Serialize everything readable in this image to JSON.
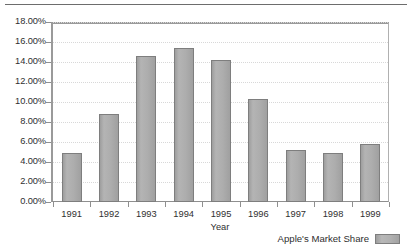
{
  "top_rule": {
    "visible": true
  },
  "chart_data": {
    "type": "bar",
    "title": "",
    "xlabel": "Year",
    "ylabel": "",
    "categories": [
      "1991",
      "1992",
      "1993",
      "1994",
      "1995",
      "1996",
      "1997",
      "1998",
      "1999"
    ],
    "values": [
      4.9,
      8.8,
      14.6,
      15.45,
      14.2,
      10.35,
      5.2,
      4.9,
      5.8
    ],
    "ylim": [
      0,
      18
    ],
    "ytick_step": 2,
    "ytick_labels": [
      "0.00%",
      "2.00%",
      "4.00%",
      "6.00%",
      "8.00%",
      "10.00%",
      "12.00%",
      "14.00%",
      "16.00%",
      "18.00%"
    ],
    "value_format": "percent",
    "grid": true,
    "grid_axis": "y",
    "legend": {
      "position": "bottom-right",
      "entries": [
        {
          "label": "Apple's Market Share",
          "color": "#adadad"
        }
      ]
    },
    "series": [
      {
        "name": "Apple's Market Share",
        "color": "#adadad",
        "values": [
          4.9,
          8.8,
          14.6,
          15.45,
          14.2,
          10.35,
          5.2,
          4.9,
          5.8
        ]
      }
    ]
  },
  "colors": {
    "bar_fill": "#adadad",
    "bar_border": "#7e7e7e",
    "grid": "#d8d8d8",
    "axis": "#8f8f8f",
    "text": "#2f2f2f",
    "background": "#ffffff"
  }
}
